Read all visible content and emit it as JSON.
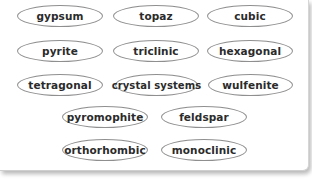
{
  "diagram": {
    "type": "word-map",
    "center_term": "crystal systems",
    "terms": [
      {
        "label": "gypsum"
      },
      {
        "label": "topaz"
      },
      {
        "label": "cubic"
      },
      {
        "label": "pyrite"
      },
      {
        "label": "triclinic"
      },
      {
        "label": "hexagonal"
      },
      {
        "label": "tetragonal"
      },
      {
        "label": "crystal systems"
      },
      {
        "label": "wulfenite"
      },
      {
        "label": "pyromophite"
      },
      {
        "label": "feldspar"
      },
      {
        "label": "orthorhombic"
      },
      {
        "label": "monoclinic"
      }
    ],
    "colors": {
      "oval_border": "#8f8f8f",
      "text": "#2b2b2b",
      "background": "#ffffff"
    }
  }
}
